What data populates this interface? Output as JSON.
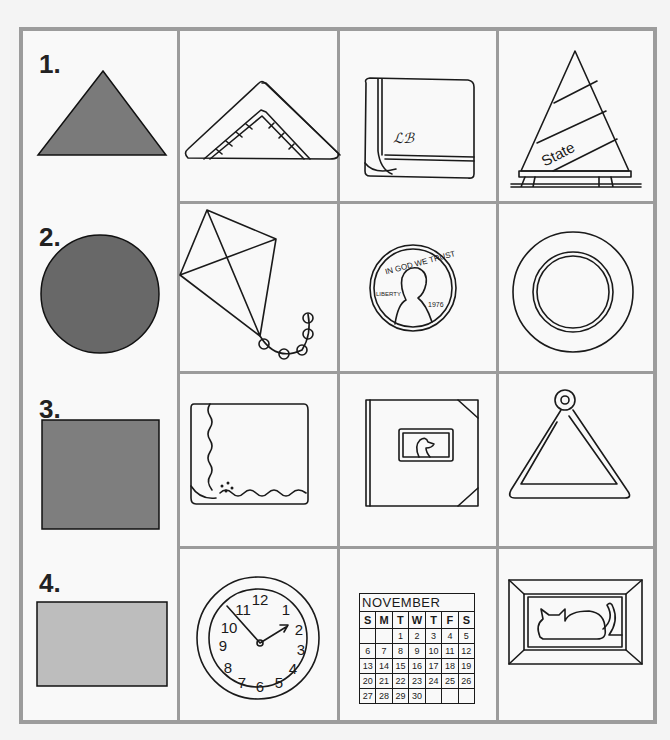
{
  "worksheet": {
    "rows": [
      {
        "number": "1.",
        "shape": "triangle",
        "shape_color": "#7a7a7a",
        "pictures": [
          "folded-napkin",
          "folded-handkerchief",
          "state-pennant"
        ]
      },
      {
        "number": "2.",
        "shape": "circle",
        "shape_color": "#686868",
        "pictures": [
          "kite",
          "penny",
          "plate"
        ]
      },
      {
        "number": "3.",
        "shape": "square",
        "shape_color": "#7e7e7e",
        "pictures": [
          "folded-napkin-scalloped",
          "photo-album",
          "musical-triangle"
        ]
      },
      {
        "number": "4.",
        "shape": "rectangle",
        "shape_color": "#bdbdbd",
        "pictures": [
          "wall-clock",
          "calendar",
          "framed-cat-picture"
        ]
      }
    ],
    "pennant_text": "State",
    "penny": {
      "motto": "IN GOD WE TRUST",
      "liberty": "LIBERTY",
      "year": "1976"
    },
    "calendar": {
      "month": "NOVEMBER",
      "days": [
        "S",
        "M",
        "T",
        "W",
        "T",
        "F",
        "S"
      ],
      "weeks": [
        [
          "",
          "",
          "1",
          "2",
          "3",
          "4",
          "5"
        ],
        [
          "6",
          "7",
          "8",
          "9",
          "10",
          "11",
          "12"
        ],
        [
          "13",
          "14",
          "15",
          "16",
          "17",
          "18",
          "19"
        ],
        [
          "20",
          "21",
          "22",
          "23",
          "24",
          "25",
          "26"
        ],
        [
          "27",
          "28",
          "29",
          "30",
          "",
          "",
          ""
        ]
      ]
    },
    "clock_numbers": [
      "12",
      "1",
      "2",
      "3",
      "4",
      "5",
      "6",
      "7",
      "8",
      "9",
      "10",
      "11"
    ]
  },
  "colors": {
    "grid": "#9c9c9c",
    "ink": "#1a1a1a"
  }
}
